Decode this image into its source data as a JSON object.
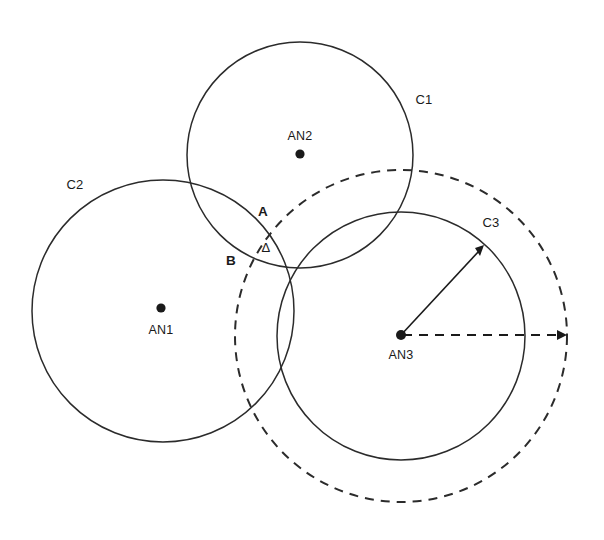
{
  "diagram": {
    "background_color": "#ffffff",
    "stroke_color": "#2b2b2b",
    "canvas": {
      "width": 604,
      "height": 540
    },
    "circles": [
      {
        "id": "C1",
        "label": "C1",
        "label_x": 424,
        "label_y": 104,
        "cx": 300,
        "cy": 155,
        "r": 113,
        "style": "solid"
      },
      {
        "id": "C2",
        "label": "C2",
        "label_x": 75,
        "label_y": 189,
        "cx": 163,
        "cy": 311,
        "r": 131,
        "style": "solid"
      },
      {
        "id": "C3",
        "label": "C3",
        "label_x": 491,
        "label_y": 227,
        "cx": 401,
        "cy": 336,
        "r": 124,
        "style": "solid"
      },
      {
        "id": "C3-uncertainty",
        "label": "",
        "label_x": 0,
        "label_y": 0,
        "cx": 401,
        "cy": 336,
        "r": 166,
        "style": "dashed"
      }
    ],
    "nodes": [
      {
        "id": "AN1",
        "label": "AN1",
        "x": 161,
        "y": 308,
        "label_x": 161,
        "label_y": 334
      },
      {
        "id": "AN2",
        "label": "AN2",
        "x": 300,
        "y": 154,
        "label_x": 300,
        "label_y": 140
      },
      {
        "id": "AN3",
        "label": "AN3",
        "x": 401,
        "y": 335,
        "label_x": 401,
        "label_y": 359
      }
    ],
    "points": [
      {
        "id": "A",
        "label": "A",
        "label_x": 263,
        "label_y": 216
      },
      {
        "id": "B",
        "label": "B",
        "label_x": 231,
        "label_y": 265
      },
      {
        "id": "delta",
        "label": "Δ",
        "label_x": 266,
        "label_y": 252
      }
    ],
    "measure_lines": [
      {
        "id": "radius-true",
        "style": "solid",
        "x1": 401,
        "y1": 335,
        "x2": 483,
        "y2": 247,
        "arrow_at_end": true
      },
      {
        "id": "radius-uncertainty",
        "style": "dashed",
        "x1": 401,
        "y1": 335,
        "x2": 566,
        "y2": 335,
        "arrow_at_end": true
      }
    ]
  }
}
